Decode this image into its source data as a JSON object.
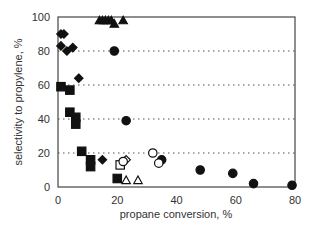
{
  "chart_data": {
    "type": "scatter",
    "title": "",
    "xlabel": "propane conversion, %",
    "ylabel": "selectivity to propylene, %",
    "xlim": [
      0,
      80
    ],
    "ylim": [
      0,
      100
    ],
    "xticks": [
      0,
      20,
      40,
      60,
      80
    ],
    "yticks": [
      0,
      20,
      40,
      60,
      80,
      100
    ],
    "grid": "horizontal dotted at 20, 40, 60, 80",
    "legend": "none",
    "series": [
      {
        "name": "filled-diamond",
        "marker": "diamond",
        "filled": true,
        "points": [
          [
            1,
            90
          ],
          [
            2,
            90
          ],
          [
            1,
            83
          ],
          [
            3,
            80
          ],
          [
            5,
            82
          ],
          [
            7,
            64
          ],
          [
            15,
            16
          ]
        ]
      },
      {
        "name": "filled-square",
        "marker": "square",
        "filled": true,
        "points": [
          [
            1,
            59
          ],
          [
            4,
            57
          ],
          [
            4,
            44
          ],
          [
            6,
            41
          ],
          [
            6,
            37
          ],
          [
            8,
            21
          ],
          [
            11,
            16
          ],
          [
            11,
            12
          ],
          [
            20,
            5
          ]
        ]
      },
      {
        "name": "filled-circle",
        "marker": "circle",
        "filled": true,
        "points": [
          [
            19,
            80
          ],
          [
            23,
            39
          ],
          [
            35,
            16
          ],
          [
            48,
            10
          ],
          [
            59,
            8
          ],
          [
            66,
            2
          ],
          [
            79,
            1
          ]
        ]
      },
      {
        "name": "filled-triangle",
        "marker": "triangle",
        "filled": true,
        "points": [
          [
            14,
            98
          ],
          [
            15,
            98
          ],
          [
            16,
            98
          ],
          [
            17,
            98
          ],
          [
            18,
            98
          ],
          [
            19,
            96
          ],
          [
            22,
            98
          ]
        ]
      },
      {
        "name": "open-square",
        "marker": "square",
        "filled": false,
        "points": [
          [
            21,
            13
          ]
        ]
      },
      {
        "name": "open-diamond",
        "marker": "diamond",
        "filled": false,
        "points": [
          [
            23,
            16
          ]
        ]
      },
      {
        "name": "open-circle",
        "marker": "circle",
        "filled": false,
        "points": [
          [
            22,
            15
          ],
          [
            32,
            20
          ],
          [
            34,
            14
          ]
        ]
      },
      {
        "name": "open-triangle",
        "marker": "triangle",
        "filled": false,
        "points": [
          [
            23,
            4
          ],
          [
            27,
            4
          ]
        ]
      }
    ]
  }
}
